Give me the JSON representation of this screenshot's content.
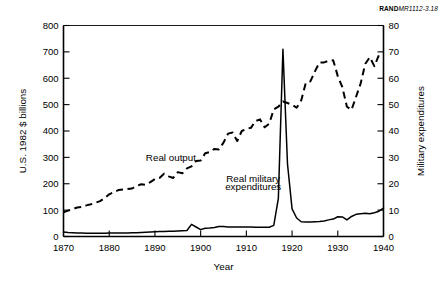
{
  "figure_id": {
    "bold": "RAND",
    "italic": "MR1112-3.18"
  },
  "chart_data": {
    "type": "line",
    "title": "",
    "subtitle": "",
    "xlabel": "Year",
    "ylabel": "U.S. 1982 $ billions",
    "y2label": "Military expenditures",
    "xlim": [
      1870,
      1940
    ],
    "ylim": [
      0,
      800
    ],
    "y2lim": [
      0,
      80
    ],
    "xticks": [
      1870,
      1880,
      1890,
      1900,
      1910,
      1920,
      1930,
      1940
    ],
    "xticklabels": [
      "1870",
      "1880",
      "1890",
      "1900",
      "1910",
      "1920",
      "1930",
      "1940"
    ],
    "yticks": [
      0,
      100,
      200,
      300,
      400,
      500,
      600,
      700,
      800
    ],
    "yticklabels": [
      "0",
      "100",
      "200",
      "300",
      "400",
      "500",
      "600",
      "700",
      "800"
    ],
    "y2ticks": [
      0,
      10,
      20,
      30,
      40,
      50,
      60,
      70,
      80
    ],
    "y2ticklabels": [
      "0",
      "10",
      "20",
      "30",
      "40",
      "50",
      "60",
      "70",
      "80"
    ],
    "grid": false,
    "legend_position": "inline-annotations",
    "annotations": [
      {
        "text": "Real output",
        "x": 1893.5,
        "y": 288,
        "name": "real-output-label"
      },
      {
        "text": "Real military",
        "x": 1911.5,
        "y": 208,
        "name": "real-military-label-line1"
      },
      {
        "text": "expenditures",
        "x": 1911.5,
        "y": 178,
        "name": "real-military-label-line2"
      }
    ],
    "series": [
      {
        "name": "Real output",
        "style": "dashed",
        "axis": "left",
        "unit": "U.S. 1982 $ billions",
        "x": [
          1870,
          1871,
          1872,
          1873,
          1874,
          1875,
          1876,
          1877,
          1878,
          1879,
          1880,
          1881,
          1882,
          1883,
          1884,
          1885,
          1886,
          1887,
          1888,
          1889,
          1890,
          1891,
          1892,
          1893,
          1894,
          1895,
          1896,
          1897,
          1898,
          1899,
          1900,
          1901,
          1902,
          1903,
          1904,
          1905,
          1906,
          1907,
          1908,
          1909,
          1910,
          1911,
          1912,
          1913,
          1914,
          1915,
          1916,
          1917,
          1918,
          1919,
          1920,
          1921,
          1922,
          1923,
          1924,
          1925,
          1926,
          1927,
          1928,
          1929,
          1930,
          1931,
          1932,
          1933,
          1934,
          1935,
          1936,
          1937,
          1938,
          1939,
          1940
        ],
        "values": [
          92,
          98,
          104,
          110,
          112,
          118,
          122,
          128,
          134,
          146,
          160,
          168,
          176,
          178,
          180,
          182,
          192,
          198,
          196,
          206,
          218,
          222,
          238,
          228,
          222,
          244,
          240,
          258,
          266,
          286,
          288,
          316,
          320,
          332,
          330,
          356,
          390,
          394,
          362,
          400,
          408,
          412,
          438,
          444,
          414,
          428,
          482,
          492,
          512,
          506,
          500,
          488,
          516,
          582,
          588,
          626,
          660,
          660,
          666,
          668,
          608,
          566,
          492,
          480,
          530,
          580,
          654,
          680,
          646,
          688,
          690
        ]
      },
      {
        "name": "Real military expenditures",
        "style": "solid",
        "axis": "right",
        "unit": "Military expenditures",
        "x": [
          1870,
          1871,
          1872,
          1873,
          1874,
          1875,
          1876,
          1877,
          1878,
          1879,
          1880,
          1881,
          1882,
          1883,
          1884,
          1885,
          1886,
          1887,
          1888,
          1889,
          1890,
          1891,
          1892,
          1893,
          1894,
          1895,
          1896,
          1897,
          1898,
          1899,
          1900,
          1901,
          1902,
          1903,
          1904,
          1905,
          1906,
          1907,
          1908,
          1909,
          1910,
          1911,
          1912,
          1913,
          1914,
          1915,
          1916,
          1917,
          1918,
          1919,
          1920,
          1921,
          1922,
          1923,
          1924,
          1925,
          1926,
          1927,
          1928,
          1929,
          1930,
          1931,
          1932,
          1933,
          1934,
          1935,
          1936,
          1937,
          1938,
          1939,
          1940
        ],
        "values": [
          1.7,
          1.5,
          1.4,
          1.3,
          1.3,
          1.2,
          1.2,
          1.2,
          1.2,
          1.2,
          1.3,
          1.3,
          1.3,
          1.3,
          1.3,
          1.4,
          1.4,
          1.5,
          1.6,
          1.7,
          1.8,
          1.9,
          1.9,
          2.0,
          2.0,
          2.1,
          2.2,
          2.3,
          4.6,
          3.6,
          2.6,
          3.1,
          3.2,
          3.4,
          3.8,
          3.8,
          3.6,
          3.6,
          3.6,
          3.6,
          3.6,
          3.6,
          3.5,
          3.5,
          3.5,
          3.5,
          4.2,
          14.5,
          71.0,
          27.5,
          10.5,
          7.0,
          5.6,
          5.5,
          5.5,
          5.6,
          5.7,
          5.9,
          6.3,
          6.6,
          7.5,
          7.4,
          6.3,
          7.6,
          8.4,
          8.6,
          8.8,
          8.6,
          9.0,
          9.6,
          10.8
        ]
      }
    ]
  }
}
